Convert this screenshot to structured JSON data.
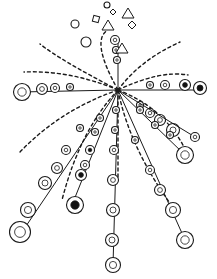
{
  "style": {
    "ink": "#1a1a1a",
    "paper": "#ffffff",
    "fill_dark": "#111111"
  },
  "center": {
    "x": 118,
    "y": 90
  },
  "top_ornaments": [
    {
      "shape": "circle",
      "x": 107,
      "y": 5,
      "r": 3
    },
    {
      "shape": "diamond",
      "x": 113,
      "y": 12,
      "s": 3
    },
    {
      "shape": "triangle-right",
      "x": 128,
      "y": 13
    },
    {
      "shape": "square",
      "x": 96,
      "y": 19,
      "s": 3
    },
    {
      "shape": "circle-hatched",
      "x": 75,
      "y": 24,
      "r": 4
    },
    {
      "shape": "diamond",
      "x": 132,
      "y": 25,
      "s": 4
    },
    {
      "shape": "triangle",
      "x": 108,
      "y": 25
    },
    {
      "shape": "circle-hatched",
      "x": 86,
      "y": 42,
      "r": 5
    },
    {
      "shape": "triangle-outline",
      "x": 122,
      "y": 48
    }
  ],
  "dashed_rays": [
    {
      "d": "M118 90 Q70 70 24 72"
    },
    {
      "d": "M118 90 Q60 110 20 152"
    },
    {
      "d": "M118 90 Q80 130 62 200"
    },
    {
      "d": "M118 90 Q140 60 180 42"
    },
    {
      "d": "M118 90 Q160 70 188 75"
    },
    {
      "d": "M118 90 Q170 110 190 160"
    },
    {
      "d": "M118 90 Q130 150 175 210"
    },
    {
      "d": "M118 90 Q60 60 40 44"
    },
    {
      "d": "M118 90 L118 180"
    },
    {
      "d": "M118 90 Q90 40 108 30"
    }
  ],
  "bead_chains": [
    {
      "from": [
        118,
        90
      ],
      "to": [
        20,
        92
      ],
      "beads": [
        [
          70,
          87,
          2
        ],
        [
          55,
          88,
          3
        ],
        [
          42,
          89,
          4
        ],
        [
          22,
          92,
          7
        ]
      ],
      "dark": []
    },
    {
      "from": [
        118,
        90
      ],
      "to": [
        22,
        232
      ],
      "beads": [
        [
          80,
          128,
          2
        ],
        [
          66,
          150,
          3
        ],
        [
          57,
          168,
          4
        ],
        [
          45,
          183,
          5
        ],
        [
          28,
          210,
          6
        ],
        [
          20,
          232,
          9
        ]
      ],
      "dark": []
    },
    {
      "from": [
        118,
        90
      ],
      "to": [
        72,
        205
      ],
      "beads": [
        [
          100,
          118,
          2
        ],
        [
          95,
          132,
          2
        ],
        [
          90,
          150,
          3
        ],
        [
          85,
          165,
          3
        ],
        [
          81,
          175,
          4
        ],
        [
          75,
          205,
          7
        ]
      ],
      "dark": [
        2,
        4,
        5
      ]
    },
    {
      "from": [
        118,
        90
      ],
      "to": [
        205,
        90
      ],
      "beads": [
        [
          150,
          85,
          2
        ],
        [
          165,
          85,
          3
        ],
        [
          185,
          85,
          4
        ],
        [
          200,
          88,
          5
        ]
      ],
      "dark": [
        2,
        3
      ]
    },
    {
      "from": [
        118,
        90
      ],
      "to": [
        185,
        155
      ],
      "beads": [
        [
          140,
          105,
          2
        ],
        [
          150,
          113,
          3
        ],
        [
          160,
          120,
          4
        ],
        [
          173,
          130,
          5
        ],
        [
          185,
          155,
          7
        ]
      ],
      "dark": []
    },
    {
      "from": [
        118,
        90
      ],
      "to": [
        195,
        137
      ],
      "beads": [
        [
          140,
          110,
          2
        ],
        [
          155,
          125,
          2
        ],
        [
          170,
          135,
          2
        ],
        [
          195,
          137,
          3
        ]
      ],
      "dark": []
    },
    {
      "from": [
        118,
        90
      ],
      "to": [
        185,
        240
      ],
      "beads": [
        [
          135,
          140,
          2
        ],
        [
          150,
          170,
          3
        ],
        [
          160,
          190,
          4
        ],
        [
          173,
          210,
          6
        ],
        [
          185,
          240,
          7
        ]
      ],
      "dark": []
    },
    {
      "from": [
        118,
        90
      ],
      "to": [
        113,
        265
      ],
      "beads": [
        [
          116,
          110,
          2
        ],
        [
          115,
          130,
          2
        ],
        [
          114,
          150,
          3
        ],
        [
          113,
          180,
          4
        ],
        [
          113,
          210,
          5
        ],
        [
          112,
          240,
          5
        ],
        [
          113,
          265,
          6
        ]
      ],
      "dark": []
    },
    {
      "from": [
        118,
        90
      ],
      "to": [
        118,
        40
      ],
      "beads": [
        [
          117,
          60,
          2
        ],
        [
          116,
          50,
          2
        ],
        [
          115,
          40,
          3
        ]
      ],
      "dark": []
    }
  ]
}
